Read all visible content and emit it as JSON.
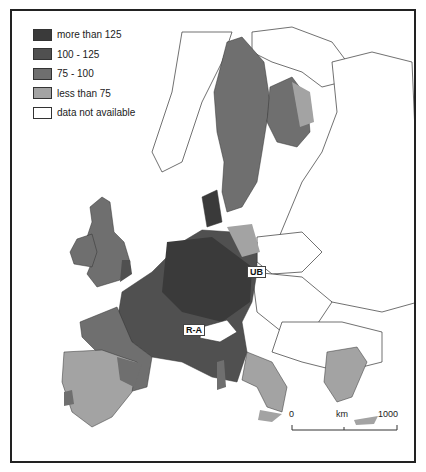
{
  "legend": {
    "items": [
      {
        "label": "more than 125",
        "color": "#3a3a3a"
      },
      {
        "label": "100 - 125",
        "color": "#505050"
      },
      {
        "label": "75 - 100",
        "color": "#6f6f6f"
      },
      {
        "label": "less than 75",
        "color": "#a3a3a3"
      },
      {
        "label": "data not available",
        "color": "#ffffff"
      }
    ]
  },
  "labels": {
    "ub": "UB",
    "ra": "R-A"
  },
  "scale": {
    "start": "0",
    "unit": "km",
    "end": "1000"
  }
}
